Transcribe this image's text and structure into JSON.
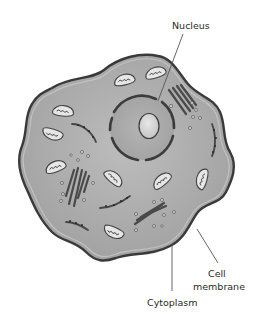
{
  "diagram": {
    "labels": {
      "nucleus": "Nucleus",
      "cell_membrane_line1": "Cell",
      "cell_membrane_line2": "membrane",
      "cytoplasm": "Cytoplasm"
    },
    "parts": [
      "cell membrane",
      "cytoplasm",
      "nucleus",
      "nucleolus",
      "nuclear envelope",
      "mitochondria",
      "endoplasmic reticulum",
      "golgi apparatus",
      "vesicles"
    ],
    "colors": {
      "cytoplasm": "#a8a8a8",
      "cytoplasm_light": "#bdbdbd",
      "membrane": "#3a3a3a",
      "nucleus": "#aaaaaa",
      "nucleolus": "#d8d8d8",
      "organelle_outline": "#444444",
      "organelle_fill": "#e6e6e6",
      "leader_line": "#555555",
      "label_text": "#2a2a2a"
    }
  }
}
